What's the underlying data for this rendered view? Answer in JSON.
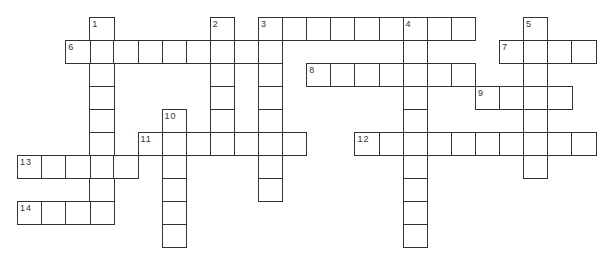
{
  "puzzle": {
    "grid": {
      "origin_x": 17,
      "origin_y": 17,
      "cell_w": 24.1,
      "cell_h": 23,
      "border_color": "#333333"
    },
    "words": [
      {
        "number": "1",
        "direction": "down",
        "col": 3,
        "row": 0,
        "length": 9
      },
      {
        "number": "2",
        "direction": "down",
        "col": 8,
        "row": 0,
        "length": 6
      },
      {
        "number": "3",
        "direction": "down",
        "col": 10,
        "row": 0,
        "length": 8
      },
      {
        "number": "3",
        "direction": "across",
        "col": 10,
        "row": 0,
        "length": 9
      },
      {
        "number": "4",
        "direction": "down",
        "col": 16,
        "row": 0,
        "length": 10
      },
      {
        "number": "5",
        "direction": "down",
        "col": 21,
        "row": 0,
        "length": 7
      },
      {
        "number": "6",
        "direction": "across",
        "col": 2,
        "row": 1,
        "length": 9
      },
      {
        "number": "7",
        "direction": "across",
        "col": 20,
        "row": 1,
        "length": 4
      },
      {
        "number": "8",
        "direction": "across",
        "col": 12,
        "row": 2,
        "length": 7
      },
      {
        "number": "9",
        "direction": "across",
        "col": 19,
        "row": 3,
        "length": 4
      },
      {
        "number": "10",
        "direction": "down",
        "col": 6,
        "row": 4,
        "length": 6
      },
      {
        "number": "11",
        "direction": "across",
        "col": 5,
        "row": 5,
        "length": 7
      },
      {
        "number": "12",
        "direction": "across",
        "col": 14,
        "row": 5,
        "length": 10
      },
      {
        "number": "13",
        "direction": "across",
        "col": 0,
        "row": 6,
        "length": 5
      },
      {
        "number": "14",
        "direction": "across",
        "col": 0,
        "row": 8,
        "length": 4
      }
    ]
  }
}
